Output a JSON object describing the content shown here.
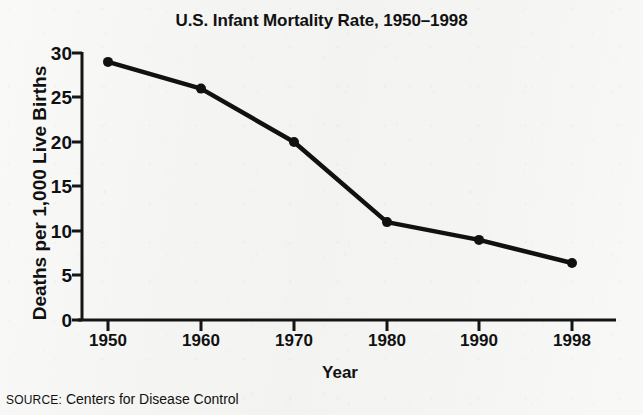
{
  "chart_data": {
    "type": "line",
    "title": "U.S. Infant Mortality Rate, 1950–1998",
    "xlabel": "Year",
    "ylabel": "Deaths per 1,000 Live Births",
    "categories": [
      "1950",
      "1960",
      "1970",
      "1980",
      "1990",
      "1998"
    ],
    "values": [
      29,
      26,
      20,
      11,
      9,
      6.4
    ],
    "series": [
      {
        "name": "Infant mortality rate",
        "values": [
          29,
          26,
          20,
          11,
          9,
          6.4
        ]
      }
    ],
    "ylim": [
      0,
      30
    ],
    "yticks": [
      "0",
      "5",
      "10",
      "15",
      "20",
      "25",
      "30"
    ],
    "ytick_values": [
      0,
      5,
      10,
      15,
      20,
      25,
      30
    ],
    "xticks": [
      "1950",
      "1960",
      "1970",
      "1980",
      "1990",
      "1998"
    ],
    "grid": false,
    "legend": false,
    "legend_position": "none",
    "marker": "filled-circle",
    "line_color": "#111111",
    "marker_color": "#111111",
    "background_color": "#f4f4f2"
  },
  "source": {
    "prefix": "SOURCE:",
    "text": "Centers for Disease Control"
  }
}
